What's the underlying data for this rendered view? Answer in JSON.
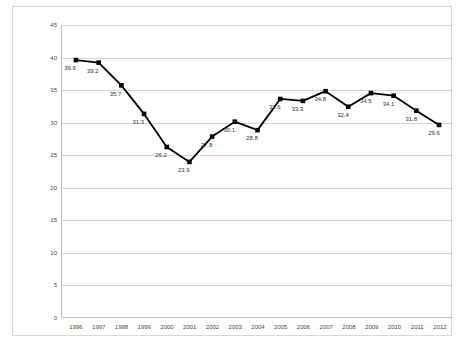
{
  "chart_data": {
    "type": "line",
    "title": "",
    "xlabel": "",
    "ylabel": "",
    "ylim": [
      0,
      45
    ],
    "ytick_step": 5,
    "yticks": [
      0,
      5,
      10,
      15,
      20,
      25,
      30,
      35,
      40,
      45
    ],
    "grid": true,
    "legend": "none",
    "line_color": "#000000",
    "marker": "square",
    "marker_color": "#000000",
    "data_labels": true,
    "categories": [
      "1996",
      "1997",
      "1998",
      "1999",
      "2000",
      "2001",
      "2002",
      "2003",
      "2004",
      "2005",
      "2006",
      "2007",
      "2008",
      "2009",
      "2010",
      "2011",
      "2012"
    ],
    "values": [
      39.6,
      39.2,
      35.7,
      31.3,
      26.2,
      23.9,
      27.8,
      30.1,
      28.8,
      33.6,
      33.3,
      34.8,
      32.4,
      34.5,
      34.1,
      31.8,
      29.6
    ],
    "value_labels": [
      "39.6",
      "39.2",
      "35.7",
      "31.3",
      "26.2",
      "23.9",
      "27.8",
      "30.1",
      "28.8",
      "33.6",
      "33.3",
      "34.8",
      "32.4",
      "34.5",
      "34.1",
      "31.8",
      "29.6"
    ]
  }
}
